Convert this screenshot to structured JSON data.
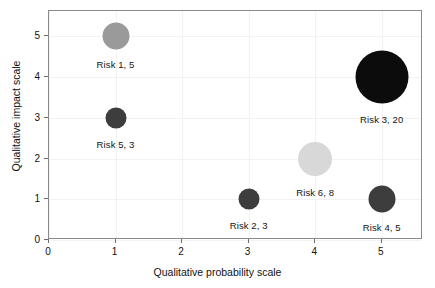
{
  "chart_data": {
    "type": "scatter",
    "title": "",
    "xlabel": "Qualitative probability scale",
    "ylabel": "Qualitative impact scale",
    "xlim": [
      0,
      5.62
    ],
    "ylim": [
      0,
      5.62
    ],
    "xticks": [
      "0",
      "1",
      "2",
      "3",
      "4",
      "5"
    ],
    "xtick_values": [
      0,
      1,
      2,
      3,
      4,
      5
    ],
    "yticks": [
      "0",
      "1",
      "2",
      "3",
      "4",
      "5"
    ],
    "ytick_values": [
      0,
      1,
      2,
      3,
      4,
      5
    ],
    "grid": true,
    "legend": "none",
    "size_key": "bubble area encodes risk score (second number in label)",
    "points": [
      {
        "label": "Risk 1, 5",
        "name": "Risk 1",
        "x": 1,
        "y": 5,
        "size": 5,
        "radius_px": 13.5,
        "color": "#9a9a9a",
        "label_dx": 0,
        "label_dy": 23
      },
      {
        "label": "Risk 5, 3",
        "name": "Risk 5",
        "x": 1,
        "y": 3,
        "size": 3,
        "radius_px": 10.5,
        "color": "#3d3d3d",
        "label_dx": 0,
        "label_dy": 21
      },
      {
        "label": "Risk 3, 20",
        "name": "Risk 3",
        "x": 5,
        "y": 4,
        "size": 20,
        "radius_px": 26.5,
        "color": "#0c0c0c",
        "label_dx": 0,
        "label_dy": 37
      },
      {
        "label": "Risk 6, 8",
        "name": "Risk 6",
        "x": 4,
        "y": 2,
        "size": 8,
        "radius_px": 17.0,
        "color": "#d8d8d8",
        "label_dx": 0,
        "label_dy": 28
      },
      {
        "label": "Risk 2, 3",
        "name": "Risk 2",
        "x": 3,
        "y": 1,
        "size": 3,
        "radius_px": 10.5,
        "color": "#3d3d3d",
        "label_dx": 0,
        "label_dy": 21
      },
      {
        "label": "Risk 4, 5",
        "name": "Risk 4",
        "x": 5,
        "y": 1,
        "size": 5,
        "radius_px": 13.5,
        "color": "#3d3d3d",
        "label_dx": 0,
        "label_dy": 23
      }
    ],
    "colors": {
      "frame": "#8a8a8a",
      "grid": "#f2f2f2",
      "text": "#111111",
      "background": "#ffffff"
    }
  }
}
